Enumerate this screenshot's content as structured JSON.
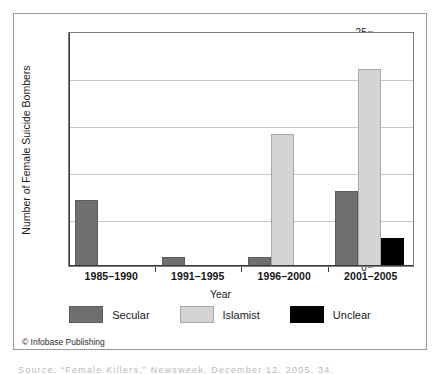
{
  "chart_data": {
    "type": "bar",
    "title": "",
    "xlabel": "Year",
    "ylabel": "Number of Female Suicide Bombers",
    "categories": [
      "1985–1990",
      "1991–1995",
      "1996–2000",
      "2001–2005"
    ],
    "series": [
      {
        "name": "Secular",
        "color": "#6f6f6f",
        "values": [
          7,
          1,
          1,
          8
        ]
      },
      {
        "name": "Islamist",
        "color": "#d4d4d4",
        "values": [
          0,
          0,
          14,
          21
        ]
      },
      {
        "name": "Unclear",
        "color": "#000000",
        "values": [
          0,
          0,
          0,
          3
        ]
      }
    ],
    "ylim": [
      0,
      25
    ],
    "yticks": [
      0,
      5,
      10,
      15,
      20,
      25
    ],
    "grid": true,
    "legend_position": "bottom"
  },
  "legend": {
    "items": [
      {
        "label": "Secular"
      },
      {
        "label": "Islamist"
      },
      {
        "label": "Unclear"
      }
    ]
  },
  "footer": {
    "credit": "© Infobase Publishing",
    "source_clipped": "Source: “Female Killers,” Newsweek, December 12, 2005, 34."
  }
}
